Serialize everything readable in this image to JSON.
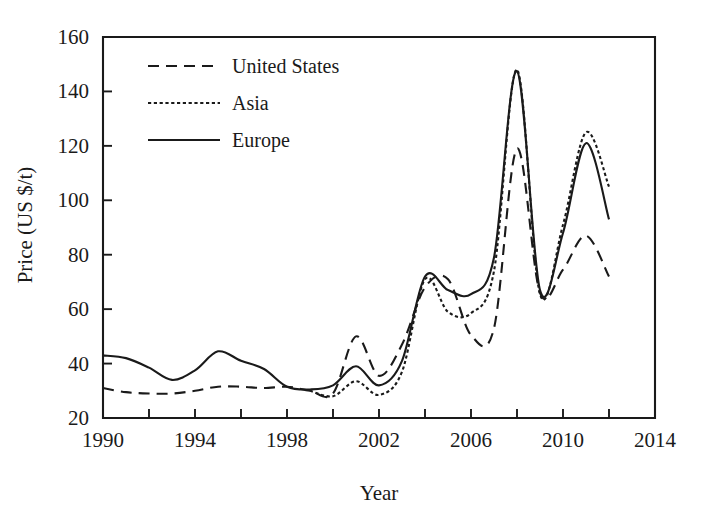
{
  "chart_data": {
    "type": "line",
    "title": "",
    "xlabel": "Year",
    "ylabel": "Price (US $/t)",
    "xlim": [
      1990,
      2014
    ],
    "ylim": [
      20,
      160
    ],
    "xticks": [
      1990,
      1992,
      1994,
      1996,
      1998,
      2000,
      2002,
      2004,
      2006,
      2008,
      2010,
      2012,
      2014
    ],
    "xtick_labels": [
      "1990",
      "",
      "1994",
      "",
      "1998",
      "",
      "2002",
      "",
      "2006",
      "",
      "2010",
      "",
      "2014"
    ],
    "yticks": [
      20,
      40,
      60,
      80,
      100,
      120,
      140,
      160
    ],
    "ytick_labels": [
      "20",
      "40",
      "60",
      "80",
      "100",
      "120",
      "140",
      "160"
    ],
    "grid": false,
    "legend_position": "upper-left-inside",
    "x": [
      1990,
      1991,
      1992,
      1993,
      1994,
      1995,
      1996,
      1997,
      1998,
      1999,
      2000,
      2001,
      2002,
      2003,
      2004,
      2005,
      2006,
      2007,
      2008,
      2009,
      2010,
      2011,
      2012
    ],
    "series": [
      {
        "name": "United States",
        "line_style": "long-dash",
        "color": "#1a1a1a",
        "values": [
          31,
          29.5,
          29,
          29,
          30,
          31.5,
          31.5,
          31,
          31.5,
          30,
          29,
          50,
          35.5,
          47,
          68,
          71,
          50.5,
          53,
          119,
          66,
          74.5,
          87,
          72
        ]
      },
      {
        "name": "Asia",
        "line_style": "dotted",
        "color": "#1a1a1a",
        "values": [
          null,
          null,
          null,
          null,
          null,
          null,
          null,
          null,
          null,
          30,
          28,
          33.5,
          28.5,
          37,
          71,
          59,
          58.5,
          74,
          148,
          65.5,
          91,
          125,
          105
        ]
      },
      {
        "name": "Europe",
        "line_style": "solid",
        "color": "#1a1a1a",
        "values": [
          43,
          42,
          38.5,
          34,
          37.5,
          44.5,
          41,
          38,
          31.5,
          30.5,
          32,
          39,
          32,
          41,
          72,
          67,
          65.5,
          79,
          147.5,
          67,
          88,
          121,
          93
        ]
      }
    ],
    "legend_entries": [
      {
        "label": "United States",
        "line_style": "long-dash"
      },
      {
        "label": "Asia",
        "line_style": "dotted"
      },
      {
        "label": "Europe",
        "line_style": "solid"
      }
    ]
  }
}
